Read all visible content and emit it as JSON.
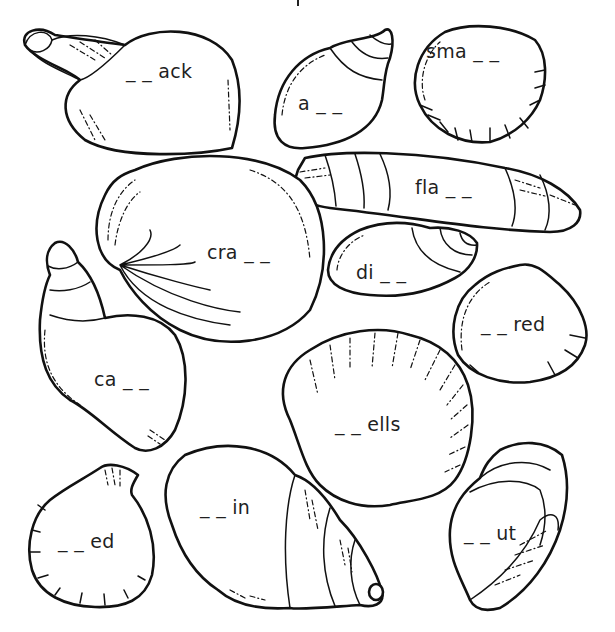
{
  "worksheet": {
    "title": "",
    "colors": {
      "ink": "#111111",
      "paper": "#ffffff"
    },
    "shells": [
      {
        "id": "whelk-top-left",
        "word": "_ _ ack",
        "x": 126,
        "y": 62
      },
      {
        "id": "snail-top-mid",
        "word": "a _ _",
        "x": 298,
        "y": 94
      },
      {
        "id": "scallop-top-right",
        "word": "sma _ _",
        "x": 426,
        "y": 42
      },
      {
        "id": "razor-shell",
        "word": "fla _ _",
        "x": 415,
        "y": 178
      },
      {
        "id": "clam-large",
        "word": "cra _ _",
        "x": 207,
        "y": 243
      },
      {
        "id": "periwinkle",
        "word": "di _ _",
        "x": 356,
        "y": 263
      },
      {
        "id": "cockle-right",
        "word": "_ _ red",
        "x": 481,
        "y": 315
      },
      {
        "id": "conch-left",
        "word": "ca _ _",
        "x": 94,
        "y": 370
      },
      {
        "id": "scallop-large",
        "word": "_ _ ells",
        "x": 335,
        "y": 415
      },
      {
        "id": "scallop-small",
        "word": "_ _ ed",
        "x": 58,
        "y": 532
      },
      {
        "id": "whelk-bottom",
        "word": "_ _ in",
        "x": 200,
        "y": 498
      },
      {
        "id": "mussel",
        "word": "_ _ ut",
        "x": 464,
        "y": 524
      }
    ]
  }
}
